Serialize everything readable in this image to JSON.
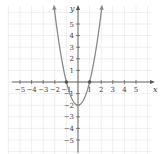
{
  "chart_data": {
    "type": "line",
    "title": "",
    "xlabel": "x",
    "ylabel": "y",
    "xlim": [
      -5.5,
      6
    ],
    "ylim": [
      -6,
      6.5
    ],
    "grid": true,
    "x_ticks": [
      -5,
      -4,
      -3,
      -2,
      -1,
      1,
      2,
      3,
      4,
      5
    ],
    "x_tick_labels": [
      "−5",
      "−4",
      "−3",
      "−2",
      "−1",
      "1",
      "2",
      "3",
      "4",
      "5"
    ],
    "y_ticks": [
      5,
      4,
      3,
      2,
      1,
      -1,
      -2,
      -3,
      -4,
      -5
    ],
    "y_tick_labels": [
      "5",
      "4",
      "3",
      "2",
      "1",
      "−1",
      "−2",
      "−3",
      "−4",
      "−5"
    ],
    "series": [
      {
        "name": "y = 2x² − 2",
        "equation": "y = 2x^2 - 2",
        "x": [
          -2.1,
          -2,
          -1.5,
          -1,
          -0.5,
          0,
          0.5,
          1,
          1.5,
          2,
          2.1
        ],
        "y": [
          6.82,
          6,
          2.5,
          0,
          -1.5,
          -2,
          -1.5,
          0,
          2.5,
          6,
          6.82
        ],
        "color": "#8a8a8a",
        "arrows_at_ends": true
      }
    ],
    "marked_points": [
      {
        "x": -1,
        "y": 0
      },
      {
        "x": 1,
        "y": 0
      }
    ]
  },
  "labels": {
    "x_axis": "x",
    "y_axis": "y"
  }
}
